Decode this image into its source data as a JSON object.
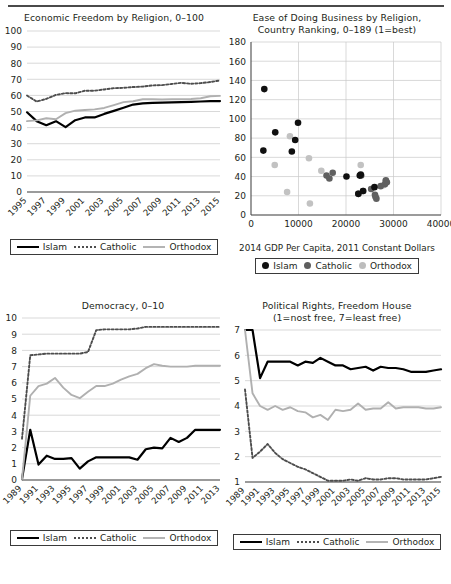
{
  "page": {
    "background": "#ffffff",
    "ink": "#231f20"
  },
  "colors": {
    "islam": "#000000",
    "catholic": "#4d4d4d",
    "orthodox": "#b0b0b0",
    "grid": "#c9c9c9",
    "axis": "#4a4a4a"
  },
  "legend": {
    "islam": "Islam",
    "catholic": "Catholic",
    "orthodox": "Orthodox"
  },
  "chart_data": [
    {
      "id": "economic-freedom",
      "type": "line",
      "title": "Economic Freedom by Religion, 0–100",
      "xlabel": "",
      "ylabel": "",
      "ylim": [
        0,
        100
      ],
      "yticks": [
        0,
        10,
        20,
        30,
        40,
        50,
        60,
        70,
        80,
        90,
        100
      ],
      "grid": true,
      "legend_position": "bottom",
      "x": [
        1995,
        1996,
        1997,
        1998,
        1999,
        2000,
        2001,
        2002,
        2003,
        2004,
        2005,
        2006,
        2007,
        2008,
        2009,
        2010,
        2011,
        2012,
        2013,
        2014,
        2015
      ],
      "xticks": [
        "1995",
        "1997",
        "1999",
        "2001",
        "2003",
        "2005",
        "2007",
        "2009",
        "2011",
        "2013",
        "2015"
      ],
      "series": [
        {
          "name": "Islam",
          "style": "solid-black",
          "values": [
            49.5,
            44.0,
            41.5,
            44.0,
            40.3,
            44.6,
            46.3,
            46.3,
            48.5,
            50.4,
            52.3,
            54.3,
            55.0,
            55.3,
            55.5,
            55.7,
            55.8,
            56.0,
            56.2,
            56.4,
            56.5
          ]
        },
        {
          "name": "Catholic",
          "style": "dotted-gray",
          "values": [
            59.9,
            56.2,
            57.8,
            60.3,
            61.4,
            61.3,
            62.9,
            62.9,
            63.7,
            64.5,
            64.7,
            65.2,
            65.5,
            66.2,
            66.4,
            67.1,
            67.8,
            67.2,
            67.6,
            68.3,
            69.3
          ]
        },
        {
          "name": "Orthodox",
          "style": "solid-lightgray",
          "values": [
            44.0,
            44.5,
            45.8,
            45.2,
            49.0,
            50.5,
            50.9,
            51.3,
            52.2,
            54.0,
            55.8,
            56.4,
            57.6,
            57.6,
            57.5,
            57.6,
            57.6,
            57.8,
            58.2,
            59.5,
            59.7
          ]
        }
      ]
    },
    {
      "id": "ease-of-doing-business",
      "type": "scatter",
      "title_line1": "Ease of Doing Business by Religion,",
      "title_line2": "Country Ranking, 0–189 (1=best)",
      "xlabel": "2014 GDP Per Capita, 2011 Constant Dollars",
      "ylabel": "",
      "xlim": [
        0,
        40000
      ],
      "ylim": [
        0,
        180
      ],
      "xticks": [
        0,
        10000,
        20000,
        30000,
        40000
      ],
      "yticks": [
        0,
        20,
        40,
        60,
        80,
        100,
        120,
        140,
        160,
        180
      ],
      "grid": true,
      "legend_position": "bottom",
      "series": [
        {
          "name": "Islam",
          "color": "#101010",
          "points": [
            [
              2800,
              131
            ],
            [
              2600,
              67
            ],
            [
              5100,
              86
            ],
            [
              8600,
              66
            ],
            [
              9300,
              78
            ],
            [
              9900,
              96
            ],
            [
              20100,
              40
            ],
            [
              22900,
              41
            ],
            [
              23100,
              42
            ],
            [
              22600,
              22
            ],
            [
              23600,
              25
            ],
            [
              26000,
              29
            ]
          ]
        },
        {
          "name": "Catholic",
          "color": "#606060",
          "points": [
            [
              15900,
              41
            ],
            [
              17200,
              44
            ],
            [
              16500,
              38
            ],
            [
              22600,
              22
            ],
            [
              23600,
              25
            ],
            [
              23200,
              41
            ],
            [
              25300,
              27
            ],
            [
              26100,
              21
            ],
            [
              26200,
              19
            ],
            [
              26400,
              17
            ],
            [
              27300,
              30
            ],
            [
              28200,
              32
            ],
            [
              28400,
              36
            ],
            [
              28600,
              34
            ]
          ]
        },
        {
          "name": "Orthodox",
          "color": "#c2c2c2",
          "points": [
            [
              5000,
              52
            ],
            [
              7600,
              24
            ],
            [
              8200,
              82
            ],
            [
              12200,
              59
            ],
            [
              12400,
              12
            ],
            [
              14800,
              46
            ],
            [
              23100,
              52
            ],
            [
              27900,
              31
            ],
            [
              28300,
              35
            ]
          ]
        }
      ]
    },
    {
      "id": "democracy",
      "type": "line",
      "title": "Democracy, 0–10",
      "xlabel": "",
      "ylabel": "",
      "ylim": [
        0,
        10
      ],
      "yticks": [
        0,
        1,
        2,
        3,
        4,
        5,
        6,
        7,
        8,
        9,
        10
      ],
      "grid": true,
      "legend_position": "bottom",
      "x": [
        1989,
        1990,
        1991,
        1992,
        1993,
        1994,
        1995,
        1996,
        1997,
        1998,
        1999,
        2000,
        2001,
        2002,
        2003,
        2004,
        2005,
        2006,
        2007,
        2008,
        2009,
        2010,
        2011,
        2012,
        2013
      ],
      "xticks": [
        "1989",
        "1991",
        "1993",
        "1995",
        "1997",
        "1999",
        "2001",
        "2003",
        "2005",
        "2007",
        "2009",
        "2011",
        "2013"
      ],
      "series": [
        {
          "name": "Islam",
          "style": "solid-black",
          "values": [
            0.05,
            3.1,
            0.95,
            1.5,
            1.3,
            1.3,
            1.35,
            0.7,
            1.15,
            1.4,
            1.4,
            1.4,
            1.4,
            1.4,
            1.25,
            1.9,
            2.0,
            1.95,
            2.6,
            2.35,
            2.6,
            3.1,
            3.1,
            3.1,
            3.1
          ]
        },
        {
          "name": "Catholic",
          "style": "dotted-gray",
          "values": [
            2.55,
            7.7,
            7.75,
            7.8,
            7.8,
            7.8,
            7.8,
            7.8,
            7.9,
            9.25,
            9.3,
            9.3,
            9.3,
            9.3,
            9.35,
            9.45,
            9.45,
            9.45,
            9.45,
            9.45,
            9.45,
            9.45,
            9.45,
            9.45,
            9.45
          ]
        },
        {
          "name": "Orthodox",
          "style": "solid-lightgray",
          "values": [
            0.05,
            5.2,
            5.8,
            5.95,
            6.3,
            5.7,
            5.25,
            5.05,
            5.45,
            5.8,
            5.8,
            5.95,
            6.2,
            6.4,
            6.55,
            6.9,
            7.15,
            7.05,
            7.0,
            7.0,
            7.0,
            7.05,
            7.05,
            7.05,
            7.05
          ]
        }
      ]
    },
    {
      "id": "political-rights",
      "type": "line",
      "title_line1": "Political Rights, Freedom House",
      "title_line2": "(1=nost free, 7=least free)",
      "xlabel": "",
      "ylabel": "",
      "ylim": [
        1,
        7
      ],
      "yticks": [
        1,
        2,
        3,
        4,
        5,
        6,
        7
      ],
      "grid": true,
      "legend_position": "bottom",
      "x": [
        1989,
        1990,
        1991,
        1992,
        1993,
        1994,
        1995,
        1996,
        1997,
        1998,
        1999,
        2000,
        2001,
        2002,
        2003,
        2004,
        2005,
        2006,
        2007,
        2008,
        2009,
        2010,
        2011,
        2012,
        2013,
        2014,
        2015
      ],
      "xticks": [
        "1989",
        "1991",
        "1993",
        "1995",
        "1997",
        "1999",
        "2001",
        "2003",
        "2005",
        "2007",
        "2009",
        "2011",
        "2013",
        "2015"
      ],
      "series": [
        {
          "name": "Islam",
          "style": "solid-black",
          "values": [
            7.0,
            7.0,
            5.1,
            5.75,
            5.75,
            5.75,
            5.75,
            5.6,
            5.75,
            5.7,
            5.9,
            5.75,
            5.6,
            5.6,
            5.45,
            5.5,
            5.55,
            5.4,
            5.55,
            5.5,
            5.5,
            5.45,
            5.35,
            5.35,
            5.35,
            5.4,
            5.45
          ]
        },
        {
          "name": "Catholic",
          "style": "dotted-gray",
          "values": [
            4.65,
            1.95,
            2.2,
            2.5,
            2.15,
            1.9,
            1.75,
            1.6,
            1.5,
            1.35,
            1.2,
            1.05,
            1.05,
            1.05,
            1.1,
            1.05,
            1.15,
            1.1,
            1.1,
            1.15,
            1.15,
            1.1,
            1.1,
            1.1,
            1.1,
            1.15,
            1.2
          ]
        },
        {
          "name": "Orthodox",
          "style": "solid-lightgray",
          "values": [
            7.0,
            4.5,
            4.0,
            3.85,
            4.0,
            3.85,
            3.95,
            3.8,
            3.75,
            3.55,
            3.65,
            3.45,
            3.85,
            3.8,
            3.85,
            4.1,
            3.85,
            3.9,
            3.9,
            4.15,
            3.9,
            3.95,
            3.95,
            3.95,
            3.9,
            3.9,
            3.95
          ]
        }
      ]
    }
  ]
}
